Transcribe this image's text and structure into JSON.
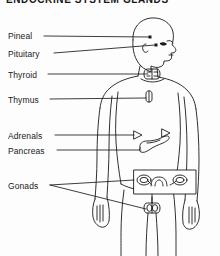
{
  "title": {
    "text": "ENDOCRINE SYSTEM GLANDS",
    "clipped": true
  },
  "diagram": {
    "line_color": "#1a1a1a",
    "background_color": "#fdfdfd",
    "figure_orientation": "head-right-profile-body-frontal"
  },
  "labels": [
    {
      "id": "pineal",
      "text": "Pineal",
      "x": 8,
      "y": 32
    },
    {
      "id": "pituitary",
      "text": "Pituitary",
      "x": 8,
      "y": 50
    },
    {
      "id": "thyroid",
      "text": "Thyroid",
      "x": 8,
      "y": 71
    },
    {
      "id": "thymus",
      "text": "Thymus",
      "x": 8,
      "y": 96
    },
    {
      "id": "adrenals",
      "text": "Adrenals",
      "x": 8,
      "y": 132
    },
    {
      "id": "pancreas",
      "text": "Pancreas",
      "x": 8,
      "y": 147
    },
    {
      "id": "gonads",
      "text": "Gonads",
      "x": 8,
      "y": 182
    }
  ],
  "glands": [
    {
      "id": "pineal",
      "name": "Pineal gland",
      "marker": "dot",
      "x": 150,
      "y": 37
    },
    {
      "id": "pituitary",
      "name": "Pituitary gland",
      "marker": "dot",
      "x": 156,
      "y": 45
    },
    {
      "id": "thyroid",
      "name": "Thyroid gland",
      "marker": "butterfly",
      "x": 152,
      "y": 73
    },
    {
      "id": "thymus",
      "name": "Thymus",
      "marker": "small-organ",
      "x": 152,
      "y": 96
    },
    {
      "id": "adrenal-left",
      "name": "Adrenal gland (left)",
      "marker": "triangle",
      "x": 138,
      "y": 135
    },
    {
      "id": "adrenal-right",
      "name": "Adrenal gland (right)",
      "marker": "triangle",
      "x": 166,
      "y": 133
    },
    {
      "id": "pancreas",
      "name": "Pancreas",
      "marker": "organ",
      "x": 152,
      "y": 143
    },
    {
      "id": "ovaries",
      "name": "Ovaries and uterus",
      "marker": "inset-box",
      "x": 166,
      "y": 182
    },
    {
      "id": "testes",
      "name": "Testes",
      "marker": "paired-oval",
      "x": 152,
      "y": 208
    }
  ]
}
